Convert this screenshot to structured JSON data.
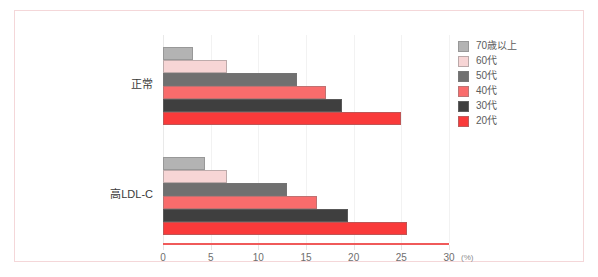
{
  "chart_data": {
    "type": "bar",
    "orientation": "horizontal",
    "title": "",
    "xlabel": "(%)",
    "ylabel": "",
    "xlim": [
      0,
      30
    ],
    "xticks": [
      0,
      5,
      10,
      15,
      20,
      25,
      30
    ],
    "xtick_labels": [
      "0",
      "5",
      "10",
      "15",
      "20",
      "25",
      "30"
    ],
    "unit_label": "(%)",
    "grid": true,
    "legend_position": "top-right",
    "categories": [
      "正常",
      "高LDL-C"
    ],
    "series": [
      {
        "name": "70歳以上",
        "color": "#b3b3b3",
        "values": [
          3.1,
          4.4
        ]
      },
      {
        "name": "60代",
        "color": "#f7d5d5",
        "values": [
          6.7,
          6.7
        ]
      },
      {
        "name": "50代",
        "color": "#707070",
        "values": [
          14.1,
          13.0
        ]
      },
      {
        "name": "40代",
        "color": "#f96c6c",
        "values": [
          17.1,
          16.2
        ]
      },
      {
        "name": "30代",
        "color": "#3f3f3f",
        "values": [
          18.8,
          19.4
        ]
      },
      {
        "name": "20代",
        "color": "#f93a3a",
        "values": [
          25.0,
          25.6
        ]
      }
    ]
  },
  "legend": {
    "items": [
      {
        "label": "70歳以上",
        "color": "#b3b3b3"
      },
      {
        "label": "60代",
        "color": "#f7d5d5"
      },
      {
        "label": "50代",
        "color": "#707070"
      },
      {
        "label": "40代",
        "color": "#f96c6c"
      },
      {
        "label": "30代",
        "color": "#3f3f3f"
      },
      {
        "label": "20代",
        "color": "#f93a3a"
      }
    ]
  },
  "axis": {
    "unit": "(%)",
    "line_color": "#f05a5a"
  },
  "frame": {
    "border_color": "#f4d7d9"
  }
}
